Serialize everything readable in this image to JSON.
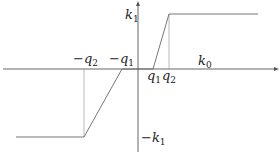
{
  "diagram": {
    "type": "piecewise-linear saturation function",
    "labels": {
      "k1": "k",
      "k1_sub": "1",
      "neg_k1": "−k",
      "neg_k1_sub": "1",
      "k0": "k",
      "k0_sub": "0",
      "neg_q2": "−q",
      "neg_q2_sub": "2",
      "neg_q1": "−q",
      "neg_q1_sub": "1",
      "q1": "q",
      "q1_sub": "1",
      "q2": "q",
      "q2_sub": "2"
    },
    "colors": {
      "axis": "#444444",
      "curve": "#555555",
      "guide": "#888888"
    }
  }
}
